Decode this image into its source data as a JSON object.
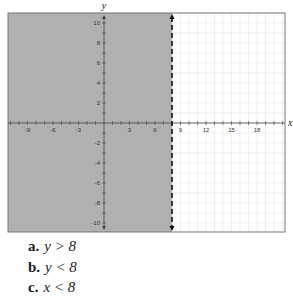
{
  "chart_data": {
    "type": "region-graph",
    "title": "",
    "xlabel": "x",
    "ylabel": "y",
    "xlim": [
      -10,
      20
    ],
    "ylim": [
      -11,
      11
    ],
    "x_ticks": [
      -9,
      -6,
      -3,
      3,
      6,
      9,
      12,
      15,
      18
    ],
    "y_ticks": [
      10,
      8,
      6,
      4,
      2,
      -2,
      -4,
      -6,
      -8,
      -10
    ],
    "grid": true,
    "boundary": {
      "type": "vertical-line",
      "x": 8,
      "style": "dashed"
    },
    "shaded_region": "x < 8",
    "shade_color": "#a9a9a9",
    "grid_color": "#e6e6e6"
  },
  "question": {
    "options": [
      {
        "letter": "a.",
        "expr": "y > 8"
      },
      {
        "letter": "b.",
        "expr": "y < 8"
      },
      {
        "letter": "c.",
        "expr": "x < 8"
      }
    ]
  }
}
